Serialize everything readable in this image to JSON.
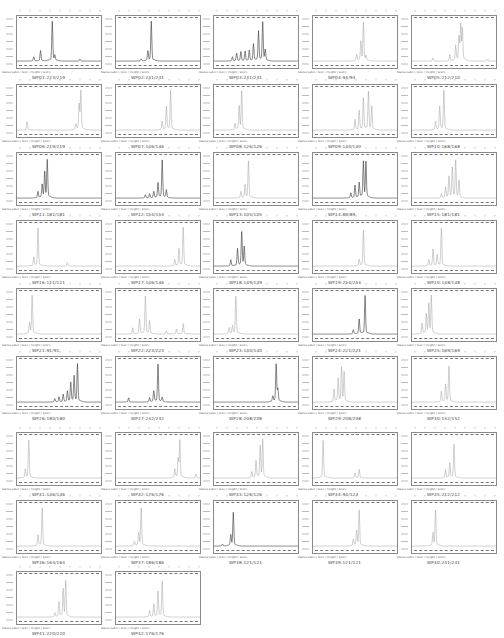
{
  "chart_data": {
    "type": "line",
    "xlabel": "Size (bp)",
    "ylabel": "Relative fluorescence units",
    "grid": false,
    "legend_text": "Status Label  |  Size  |  Height  |  Score",
    "panels": [
      {
        "label": "WP01:223/219",
        "peaks": [
          [
            0.2,
            0.1
          ],
          [
            0.28,
            0.25
          ],
          [
            0.42,
            0.95
          ],
          [
            0.45,
            0.12
          ],
          [
            0.75,
            0.05
          ]
        ],
        "style": "dark"
      },
      {
        "label": "WP02:231/231",
        "peaks": [
          [
            0.3,
            0.05
          ],
          [
            0.38,
            0.22
          ],
          [
            0.42,
            0.95
          ]
        ],
        "style": "dark"
      },
      {
        "label": "WP03:231/231",
        "peaks": [
          [
            0.22,
            0.1
          ],
          [
            0.27,
            0.18
          ],
          [
            0.32,
            0.22
          ],
          [
            0.37,
            0.23
          ],
          [
            0.42,
            0.25
          ],
          [
            0.47,
            0.4
          ],
          [
            0.53,
            0.7
          ],
          [
            0.58,
            0.92
          ],
          [
            0.61,
            0.25
          ]
        ],
        "style": "dark"
      },
      {
        "label": "WP04:94/94",
        "peaks": [
          [
            0.52,
            0.15
          ],
          [
            0.57,
            0.45
          ],
          [
            0.6,
            0.9
          ],
          [
            0.63,
            0.1
          ]
        ],
        "style": "light"
      },
      {
        "label": "WP05:212/210",
        "peaks": [
          [
            0.25,
            0.08
          ],
          [
            0.45,
            0.15
          ],
          [
            0.52,
            0.35
          ],
          [
            0.56,
            0.55
          ],
          [
            0.58,
            0.85
          ],
          [
            0.6,
            0.75
          ],
          [
            0.9,
            0.05
          ]
        ],
        "style": "light"
      },
      {
        "label": "WP06:219/219",
        "peaks": [
          [
            0.12,
            0.2
          ],
          [
            0.7,
            0.12
          ],
          [
            0.74,
            0.6
          ],
          [
            0.76,
            0.95
          ]
        ],
        "style": "light"
      },
      {
        "label": "WP07:146/146",
        "peaks": [
          [
            0.55,
            0.2
          ],
          [
            0.6,
            0.55
          ],
          [
            0.65,
            0.95
          ]
        ],
        "style": "light"
      },
      {
        "label": "WP08:126/126",
        "peaks": [
          [
            0.25,
            0.15
          ],
          [
            0.3,
            0.55
          ],
          [
            0.33,
            0.92
          ]
        ],
        "style": "light"
      },
      {
        "label": "WP09:140/140",
        "peaks": [
          [
            0.5,
            0.25
          ],
          [
            0.55,
            0.45
          ],
          [
            0.6,
            0.75
          ],
          [
            0.66,
            0.9
          ],
          [
            0.7,
            0.55
          ]
        ],
        "style": "light"
      },
      {
        "label": "WP10:168/168",
        "peaks": [
          [
            0.28,
            0.2
          ],
          [
            0.33,
            0.55
          ],
          [
            0.38,
            0.95
          ]
        ],
        "style": "light"
      },
      {
        "label": "WP11:181/181",
        "peaks": [
          [
            0.25,
            0.15
          ],
          [
            0.3,
            0.3
          ],
          [
            0.33,
            0.6
          ],
          [
            0.36,
            0.9
          ]
        ],
        "style": "dark"
      },
      {
        "label": "WP12:154/154",
        "peaks": [
          [
            0.35,
            0.08
          ],
          [
            0.4,
            0.1
          ],
          [
            0.45,
            0.15
          ],
          [
            0.5,
            0.35
          ],
          [
            0.55,
            0.9
          ],
          [
            0.6,
            0.18
          ]
        ],
        "style": "dark"
      },
      {
        "label": "WP13:105/105",
        "peaks": [
          [
            0.32,
            0.15
          ],
          [
            0.37,
            0.3
          ],
          [
            0.41,
            0.88
          ]
        ],
        "style": "light"
      },
      {
        "label": "WP14:89/89",
        "peaks": [
          [
            0.45,
            0.12
          ],
          [
            0.5,
            0.3
          ],
          [
            0.55,
            0.35
          ],
          [
            0.6,
            0.85
          ],
          [
            0.63,
            0.85
          ]
        ],
        "style": "dark"
      },
      {
        "label": "WP15:181/181",
        "peaks": [
          [
            0.35,
            0.1
          ],
          [
            0.4,
            0.25
          ],
          [
            0.44,
            0.5
          ],
          [
            0.48,
            0.7
          ],
          [
            0.52,
            0.88
          ],
          [
            0.56,
            0.4
          ]
        ],
        "style": "light"
      },
      {
        "label": "WP16:111/111",
        "peaks": [
          [
            0.2,
            0.2
          ],
          [
            0.25,
            0.9
          ],
          [
            0.6,
            0.08
          ]
        ],
        "style": "light"
      },
      {
        "label": "WP17:146/146",
        "peaks": [
          [
            0.7,
            0.15
          ],
          [
            0.75,
            0.4
          ],
          [
            0.8,
            0.92
          ]
        ],
        "style": "light"
      },
      {
        "label": "WP18:149/149",
        "peaks": [
          [
            0.2,
            0.15
          ],
          [
            0.28,
            0.4
          ],
          [
            0.33,
            0.8
          ],
          [
            0.36,
            0.45
          ]
        ],
        "style": "dark"
      },
      {
        "label": "WP19:254/254",
        "peaks": [
          [
            0.55,
            0.15
          ],
          [
            0.6,
            0.85
          ]
        ],
        "style": "light"
      },
      {
        "label": "WP20:148/148",
        "peaks": [
          [
            0.2,
            0.15
          ],
          [
            0.25,
            0.4
          ],
          [
            0.3,
            0.25
          ],
          [
            0.35,
            0.9
          ]
        ],
        "style": "light"
      },
      {
        "label": "WP21:91/91",
        "peaks": [
          [
            0.15,
            0.25
          ],
          [
            0.18,
            0.92
          ]
        ],
        "style": "light"
      },
      {
        "label": "WP22:223/223",
        "peaks": [
          [
            0.2,
            0.15
          ],
          [
            0.28,
            0.35
          ],
          [
            0.35,
            0.9
          ],
          [
            0.4,
            0.3
          ],
          [
            0.6,
            0.08
          ],
          [
            0.72,
            0.12
          ],
          [
            0.8,
            0.25
          ]
        ],
        "style": "light"
      },
      {
        "label": "WP23:140/140",
        "peaks": [
          [
            0.18,
            0.15
          ],
          [
            0.22,
            0.18
          ],
          [
            0.26,
            0.9
          ]
        ],
        "style": "light"
      },
      {
        "label": "WP24:221/221",
        "peaks": [
          [
            0.48,
            0.1
          ],
          [
            0.55,
            0.35
          ],
          [
            0.62,
            0.92
          ]
        ],
        "style": "dark"
      },
      {
        "label": "WP25:169/169",
        "peaks": [
          [
            0.12,
            0.25
          ],
          [
            0.17,
            0.45
          ],
          [
            0.2,
            0.7
          ],
          [
            0.23,
            0.9
          ]
        ],
        "style": "light"
      },
      {
        "label": "WP26:180/180",
        "peaks": [
          [
            0.45,
            0.08
          ],
          [
            0.5,
            0.12
          ],
          [
            0.55,
            0.18
          ],
          [
            0.6,
            0.25
          ],
          [
            0.64,
            0.45
          ],
          [
            0.68,
            0.6
          ],
          [
            0.72,
            0.9
          ]
        ],
        "style": "dark"
      },
      {
        "label": "WP27:242/242",
        "peaks": [
          [
            0.15,
            0.1
          ],
          [
            0.4,
            0.1
          ],
          [
            0.45,
            0.25
          ],
          [
            0.5,
            0.9
          ],
          [
            0.55,
            0.1
          ]
        ],
        "style": "dark"
      },
      {
        "label": "WP28:208/208",
        "peaks": [
          [
            0.7,
            0.12
          ],
          [
            0.74,
            0.9
          ],
          [
            0.76,
            0.3
          ]
        ],
        "style": "dark"
      },
      {
        "label": "WP29:208/208",
        "peaks": [
          [
            0.25,
            0.3
          ],
          [
            0.3,
            0.55
          ],
          [
            0.34,
            0.8
          ],
          [
            0.37,
            0.7
          ]
        ],
        "style": "light"
      },
      {
        "label": "WP30:152/152",
        "peaks": [
          [
            0.35,
            0.25
          ],
          [
            0.4,
            0.4
          ],
          [
            0.44,
            0.85
          ]
        ],
        "style": "light"
      },
      {
        "label": "WP31:146/146",
        "peaks": [
          [
            0.1,
            0.2
          ],
          [
            0.14,
            0.9
          ]
        ],
        "style": "light"
      },
      {
        "label": "WP32:176/176",
        "peaks": [
          [
            0.7,
            0.2
          ],
          [
            0.74,
            0.45
          ],
          [
            0.76,
            0.9
          ],
          [
            0.95,
            0.1
          ]
        ],
        "style": "light"
      },
      {
        "label": "WP33:126/126",
        "peaks": [
          [
            0.45,
            0.15
          ],
          [
            0.5,
            0.4
          ],
          [
            0.55,
            0.75
          ],
          [
            0.58,
            0.9
          ]
        ],
        "style": "light"
      },
      {
        "label": "WP34:94/124",
        "peaks": [
          [
            0.12,
            0.9
          ],
          [
            0.5,
            0.12
          ],
          [
            0.55,
            0.2
          ]
        ],
        "style": "light"
      },
      {
        "label": "WP35:212/212",
        "peaks": [
          [
            0.4,
            0.2
          ],
          [
            0.45,
            0.35
          ],
          [
            0.5,
            0.8
          ]
        ],
        "style": "light"
      },
      {
        "label": "WP36:164/164",
        "peaks": [
          [
            0.25,
            0.25
          ],
          [
            0.3,
            0.9
          ]
        ],
        "style": "light"
      },
      {
        "label": "WP37:186/186",
        "peaks": [
          [
            0.22,
            0.1
          ],
          [
            0.27,
            0.3
          ],
          [
            0.3,
            0.9
          ]
        ],
        "style": "light"
      },
      {
        "label": "WP38:121/121",
        "peaks": [
          [
            0.1,
            0.05
          ],
          [
            0.2,
            0.25
          ],
          [
            0.23,
            0.8
          ]
        ],
        "style": "dark"
      },
      {
        "label": "WP39:121/121",
        "peaks": [
          [
            0.48,
            0.15
          ],
          [
            0.52,
            0.35
          ],
          [
            0.55,
            0.85
          ]
        ],
        "style": "light"
      },
      {
        "label": "WP40:241/241",
        "peaks": [
          [
            0.25,
            0.3
          ],
          [
            0.28,
            0.85
          ]
        ],
        "style": "light"
      },
      {
        "label": "WP41:220/220",
        "peaks": [
          [
            0.45,
            0.1
          ],
          [
            0.5,
            0.35
          ],
          [
            0.55,
            0.65
          ],
          [
            0.58,
            0.85
          ]
        ],
        "style": "light"
      },
      {
        "label": "WP42:176/176",
        "peaks": [
          [
            0.4,
            0.15
          ],
          [
            0.45,
            0.3
          ],
          [
            0.5,
            0.6
          ],
          [
            0.55,
            0.85
          ]
        ],
        "style": "light"
      }
    ]
  }
}
